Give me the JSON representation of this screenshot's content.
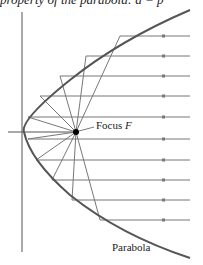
{
  "caption": "property of the parabola: a = p",
  "diagram": {
    "focus_label_prefix": "Focus ",
    "focus_label_var": "F",
    "curve_label": "Parabola",
    "colors": {
      "curve": "#555555",
      "ray": "#777777",
      "axis": "#444444",
      "focus": "#000000"
    },
    "focus": {
      "x": 76,
      "y": 132
    },
    "directrix_x": 22,
    "ray_ys": [
      36,
      56,
      76,
      96,
      117,
      139,
      160,
      180,
      200,
      220
    ]
  }
}
